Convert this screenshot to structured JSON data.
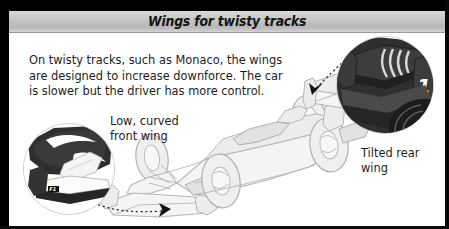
{
  "header": {
    "title": "Wings for twisty tracks"
  },
  "body": {
    "paragraph_line1": "On twisty tracks, such as Monaco, the wings",
    "paragraph_line2": "are designed to increase downforce. The car",
    "paragraph_line3": "is slower but the driver has more control."
  },
  "callouts": {
    "front_wing": {
      "line1": "Low, curved",
      "line2": "front wing"
    },
    "rear_wing": {
      "line1": "Tilted rear",
      "line2": "wing"
    }
  },
  "insets": {
    "front_wing_detail": {
      "name": "front-wing-closeup",
      "badge_text": "F1"
    },
    "rear_wing_detail": {
      "name": "rear-wing-closeup",
      "badge_text": "1"
    }
  },
  "illustration": {
    "subject": "formula-one-race-car",
    "view": "front-three-quarter"
  },
  "colors": {
    "frame": "#000000",
    "header_gradient_top": "#d9d9d9",
    "header_gradient_bottom": "#b8b8b8",
    "panel_background": "#ffffff",
    "text": "#1d1d1d",
    "car_outline": "#b4b4b4",
    "car_fill": "#f2f2f2",
    "inset_dark": "#2b2b2b",
    "pointer": "#141414"
  }
}
